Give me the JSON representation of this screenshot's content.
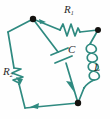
{
  "figure": {
    "kind": "electrical-circuit-diagram",
    "background_color": "#fefefe",
    "wire_color": "#2f8a80",
    "node_color": "#14120f",
    "label_color": "#2b2b2b",
    "width": 110,
    "height": 119
  },
  "labels": {
    "r1": {
      "symbol": "R",
      "subscript": "1",
      "text": "R1"
    },
    "r2": {
      "symbol": "R",
      "subscript": "2",
      "text": "R2"
    },
    "c": {
      "symbol": "C",
      "subscript": "",
      "text": "C"
    },
    "l": {
      "symbol": "L",
      "subscript": "",
      "text": "L"
    }
  },
  "components": [
    {
      "name": "resistor-r1",
      "label": "R1",
      "type": "resistor",
      "edge": "top-right"
    },
    {
      "name": "resistor-r2",
      "label": "R2",
      "type": "resistor",
      "edge": "left"
    },
    {
      "name": "capacitor-c",
      "label": "C",
      "type": "capacitor",
      "edge": "diagonal-center"
    },
    {
      "name": "inductor-l",
      "label": "L",
      "type": "inductor",
      "edge": "right"
    }
  ],
  "nodes": [
    {
      "name": "node-top-left",
      "x": 33,
      "y": 19
    },
    {
      "name": "node-right",
      "x": 98,
      "y": 30
    },
    {
      "name": "node-bottom",
      "x": 78,
      "y": 103
    }
  ],
  "current_arrows": [
    {
      "name": "arrow-top-branch",
      "direction": "right"
    },
    {
      "name": "arrow-capacitor-branch",
      "direction": "down-right"
    },
    {
      "name": "arrow-bottom-branch",
      "direction": "down-left"
    },
    {
      "name": "arrow-left-branch",
      "direction": "down"
    }
  ]
}
